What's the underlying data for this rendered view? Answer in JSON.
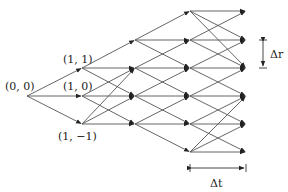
{
  "diagram": {
    "type": "trinomial-tree",
    "colors": {
      "edge": "#555555",
      "text": "#222222",
      "background": "#ffffff"
    },
    "columns_x": [
      27,
      82,
      135,
      190,
      246
    ],
    "row_y": {
      "3": 11,
      "2": 40,
      "1": 68,
      "0": 96,
      "-1": 124,
      "-2": 152
    },
    "labels": [
      {
        "id": "node-0-0",
        "text": "(0, 0)",
        "x": 5,
        "y": 90
      },
      {
        "id": "node-1-1",
        "text": "(1, 1)",
        "x": 63,
        "y": 63
      },
      {
        "id": "node-1-0",
        "text": "(1, 0)",
        "x": 63,
        "y": 90
      },
      {
        "id": "node-1-m1",
        "text": "(1, −1)",
        "x": 58,
        "y": 140
      }
    ],
    "dimension_labels": {
      "delta_r": "Δr",
      "delta_t": "Δt"
    },
    "edges": [
      [
        0,
        0,
        1,
        1
      ],
      [
        0,
        0,
        1,
        0
      ],
      [
        0,
        0,
        1,
        -1
      ],
      [
        1,
        1,
        2,
        2
      ],
      [
        1,
        1,
        2,
        1
      ],
      [
        1,
        1,
        2,
        0
      ],
      [
        1,
        0,
        2,
        1
      ],
      [
        1,
        0,
        2,
        0
      ],
      [
        1,
        0,
        2,
        -1
      ],
      [
        1,
        -1,
        2,
        1
      ],
      [
        1,
        -1,
        2,
        0
      ],
      [
        1,
        -1,
        2,
        -1
      ],
      [
        2,
        2,
        3,
        3
      ],
      [
        2,
        2,
        3,
        2
      ],
      [
        2,
        2,
        3,
        1
      ],
      [
        2,
        1,
        3,
        2
      ],
      [
        2,
        1,
        3,
        1
      ],
      [
        2,
        1,
        3,
        0
      ],
      [
        2,
        0,
        3,
        1
      ],
      [
        2,
        0,
        3,
        0
      ],
      [
        2,
        0,
        3,
        -1
      ],
      [
        2,
        -1,
        3,
        0
      ],
      [
        2,
        -1,
        3,
        -1
      ],
      [
        2,
        -1,
        3,
        -2
      ],
      [
        3,
        3,
        4,
        3
      ],
      [
        3,
        3,
        4,
        2
      ],
      [
        3,
        3,
        4,
        1
      ],
      [
        3,
        2,
        4,
        3
      ],
      [
        3,
        2,
        4,
        2
      ],
      [
        3,
        2,
        4,
        1
      ],
      [
        3,
        1,
        4,
        2
      ],
      [
        3,
        1,
        4,
        1
      ],
      [
        3,
        1,
        4,
        0
      ],
      [
        3,
        0,
        4,
        1
      ],
      [
        3,
        0,
        4,
        0
      ],
      [
        3,
        0,
        4,
        -1
      ],
      [
        3,
        -1,
        4,
        0
      ],
      [
        3,
        -1,
        4,
        -1
      ],
      [
        3,
        -1,
        4,
        -2
      ],
      [
        3,
        -2,
        4,
        -1
      ],
      [
        3,
        -2,
        4,
        -2
      ],
      [
        3,
        -2,
        4,
        0
      ]
    ]
  }
}
